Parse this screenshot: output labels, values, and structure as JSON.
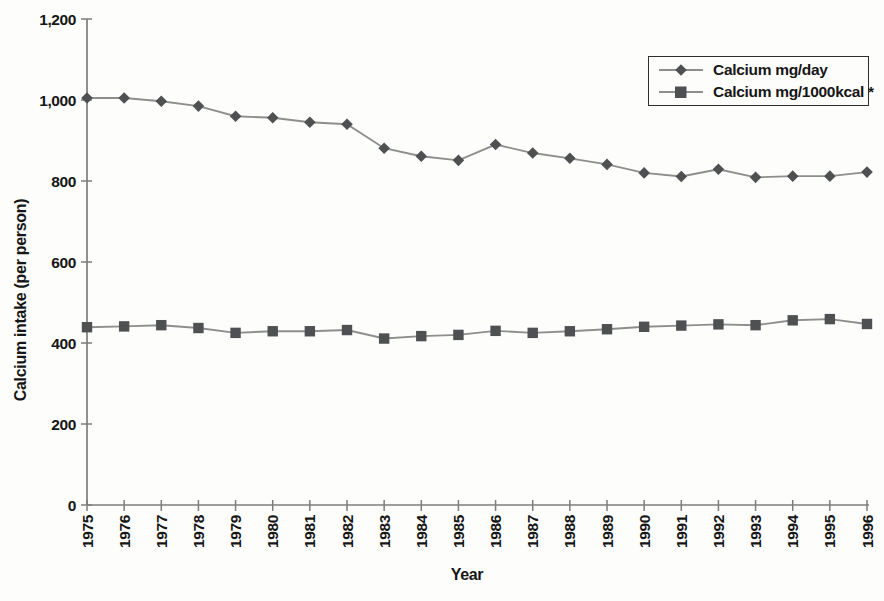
{
  "colors": {
    "background": "#fdfdfc",
    "marker": "#4e5052",
    "line": "#8e8e8e",
    "axis": "#7d7d7d",
    "text": "#161616",
    "legend_border": "#2e2e2e"
  },
  "chart_data": {
    "type": "line",
    "title": "",
    "xlabel": "Year",
    "ylabel": "Calcium intake (per person)",
    "x_tick_labels": [
      "1975",
      "1976",
      "1977",
      "1978",
      "1979",
      "1980",
      "1981",
      "1982",
      "1983",
      "1984",
      "1985",
      "1986",
      "1987",
      "1988",
      "1989",
      "1990",
      "1991",
      "1992",
      "1993",
      "1994",
      "1995",
      "1996"
    ],
    "y_ticks": [
      0,
      200,
      400,
      600,
      800,
      1000,
      1200
    ],
    "y_tick_labels": [
      "0",
      "200",
      "400",
      "600",
      "800",
      "1,000",
      "1,200"
    ],
    "ylim": [
      0,
      1200
    ],
    "grid": false,
    "legend_position": "top-right",
    "series": [
      {
        "name": "Calcium mg/day",
        "marker": "diamond",
        "values": [
          1005,
          1005,
          997,
          985,
          960,
          956,
          945,
          940,
          881,
          861,
          851,
          890,
          869,
          856,
          841,
          820,
          811,
          829,
          809,
          812,
          812,
          822
        ]
      },
      {
        "name": "Calcium mg/1000kcal *",
        "marker": "square",
        "values": [
          439,
          441,
          444,
          437,
          425,
          429,
          429,
          432,
          411,
          417,
          420,
          430,
          425,
          429,
          434,
          440,
          443,
          446,
          444,
          456,
          459,
          447
        ]
      }
    ]
  }
}
